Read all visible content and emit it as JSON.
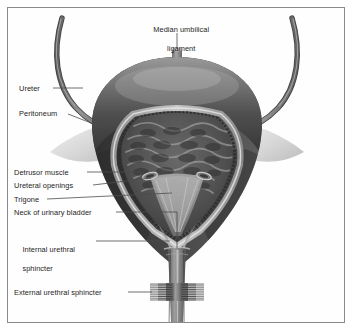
{
  "figure": {
    "background_color": "#ffffff",
    "frame_color": "#8a8a8a",
    "text_color": "#1d1d1d",
    "style": "grayscale medical illustration"
  },
  "labels": {
    "median_umbilical_ligament_line1": "Median umbilical",
    "median_umbilical_ligament_line2": "ligament",
    "ureter": "Ureter",
    "peritoneum": "Peritoneum",
    "detrusor_muscle": "Detrusor muscle",
    "ureteral_openings": "Ureteral openings",
    "trigone": "Trigone",
    "neck_of_urinary_bladder": "Neck of urinary bladder",
    "internal_urethral_sphincter_line1": "Internal urethral",
    "internal_urethral_sphincter_line2": "sphincter",
    "external_urethral_sphincter": "External urethral sphincter"
  },
  "anatomy": {
    "structures": [
      "median umbilical ligament",
      "ureter (left)",
      "ureter (right)",
      "peritoneum",
      "detrusor muscle",
      "ureteral openings",
      "trigone",
      "neck of urinary bladder",
      "internal urethral sphincter",
      "external urethral sphincter",
      "urethra",
      "bladder mucosa with rugae"
    ],
    "colors": {
      "bladder_wall_dark": "#4a4a4a",
      "bladder_wall_mid": "#6e6e6e",
      "cavity_dark": "#3a3a3a",
      "mucosa_light": "#b9b9b9",
      "peritoneum_pale": "#dcdcdc",
      "ureter_gray": "#7b7b7b",
      "sphincter_gray": "#8c8c8c",
      "leader_line": "#4d4d4d"
    }
  }
}
